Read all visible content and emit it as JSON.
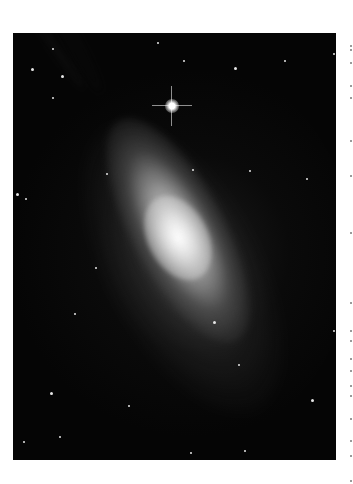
{
  "image": {
    "subject": "edge-on starburst galaxy with bright foreground star",
    "alt": "Grayscale astronomical image of an elongated galaxy with dark dust lanes, a bright star with diffraction spikes at upper center, and scattered faint stars on a black background",
    "background_color": "#050505",
    "border_color": "#ffffff",
    "bright_star": {
      "x": 171,
      "y": 105
    }
  },
  "stars": [
    {
      "x": 18,
      "y": 35
    },
    {
      "x": 39,
      "y": 15
    },
    {
      "x": 144,
      "y": 9
    },
    {
      "x": 170,
      "y": 27
    },
    {
      "x": 221,
      "y": 34
    },
    {
      "x": 271,
      "y": 27
    },
    {
      "x": 320,
      "y": 20
    },
    {
      "x": 39,
      "y": 64
    },
    {
      "x": 48,
      "y": 42
    },
    {
      "x": 179,
      "y": 136
    },
    {
      "x": 236,
      "y": 137
    },
    {
      "x": 93,
      "y": 140
    },
    {
      "x": 3,
      "y": 160
    },
    {
      "x": 12,
      "y": 165
    },
    {
      "x": 82,
      "y": 234
    },
    {
      "x": 61,
      "y": 280
    },
    {
      "x": 37,
      "y": 359
    },
    {
      "x": 46,
      "y": 403
    },
    {
      "x": 115,
      "y": 372
    },
    {
      "x": 177,
      "y": 419
    },
    {
      "x": 298,
      "y": 366
    },
    {
      "x": 320,
      "y": 297
    },
    {
      "x": 231,
      "y": 417
    },
    {
      "x": 225,
      "y": 331
    },
    {
      "x": 200,
      "y": 288
    },
    {
      "x": 293,
      "y": 145
    },
    {
      "x": 10,
      "y": 408
    }
  ],
  "side_marks": [
    5,
    9,
    22,
    45,
    57,
    100,
    135,
    192,
    262,
    290,
    300,
    318,
    330,
    345,
    355,
    378,
    400,
    415,
    440
  ]
}
